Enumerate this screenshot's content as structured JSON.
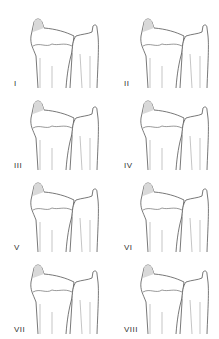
{
  "figure": {
    "panels": [
      {
        "label": "I"
      },
      {
        "label": "II"
      },
      {
        "label": "III"
      },
      {
        "label": "IV"
      },
      {
        "label": "V"
      },
      {
        "label": "VI"
      },
      {
        "label": "VII"
      },
      {
        "label": "VIII"
      }
    ],
    "colors": {
      "line": "#555555",
      "shade": "#d9d9d9",
      "background": "#ffffff"
    }
  }
}
